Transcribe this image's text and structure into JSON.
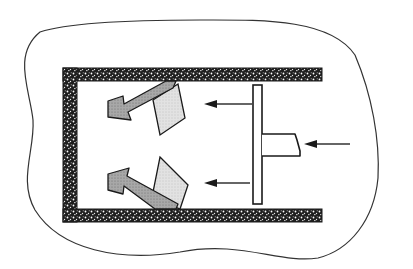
{
  "diagram": {
    "elements": {
      "boundary": "outer closed region outline",
      "walls": [
        "top wall",
        "left wall",
        "bottom wall"
      ],
      "piston_plate": "vertical piston plate",
      "piston_rod": "horizontal rod with broken end",
      "push_arrow": "force arrow on rod (leftward)",
      "flow_arrows": [
        "upper flow arrow (leftward)",
        "lower flow arrow (leftward)"
      ],
      "deflected_flows": [
        "upper deflected flow arrow",
        "lower deflected flow arrow"
      ],
      "paddles": [
        "upper light paddle",
        "lower light paddle"
      ]
    },
    "colors": {
      "line": "#1a1a1a",
      "wall_fill": "#2a2a2a",
      "arrow_dark_fill": "#9a9a9a",
      "paddle_light_fill": "#d8d8d8",
      "background": "#ffffff"
    }
  }
}
